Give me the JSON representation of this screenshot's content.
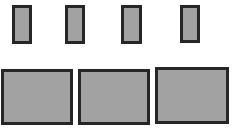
{
  "colors": {
    "background": "#ffffff",
    "fill": "#a2a2a2",
    "border": "#262626"
  },
  "top_row": {
    "items": [
      {
        "id": "small-1",
        "x": 12,
        "y": 5,
        "w": 20,
        "h": 39
      },
      {
        "id": "small-2",
        "x": 65,
        "y": 5,
        "w": 20,
        "h": 39
      },
      {
        "id": "small-3",
        "x": 121,
        "y": 5,
        "w": 21,
        "h": 39
      },
      {
        "id": "small-4",
        "x": 180,
        "y": 5,
        "w": 20,
        "h": 38
      }
    ]
  },
  "bottom_row": {
    "items": [
      {
        "id": "large-1",
        "x": 1,
        "y": 69,
        "w": 72,
        "h": 56
      },
      {
        "id": "large-2",
        "x": 78,
        "y": 69,
        "w": 72,
        "h": 56
      },
      {
        "id": "large-3",
        "x": 155,
        "y": 67,
        "w": 74,
        "h": 57
      }
    ]
  }
}
